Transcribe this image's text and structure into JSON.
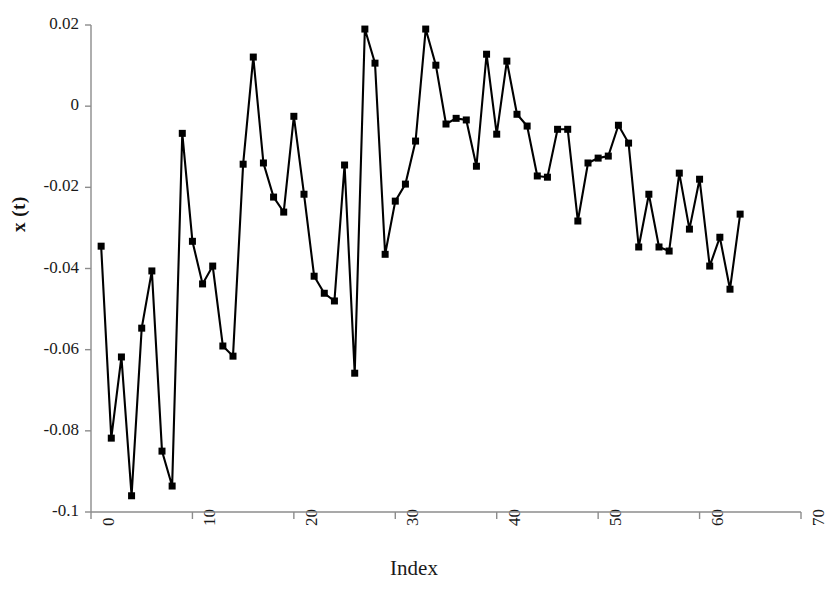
{
  "chart_data": {
    "type": "line",
    "title": "",
    "xlabel": "Index",
    "ylabel": "x (t)",
    "xlim": [
      0,
      70
    ],
    "ylim": [
      -0.1,
      0.02
    ],
    "xticks": [
      0,
      10,
      20,
      30,
      40,
      50,
      60,
      70
    ],
    "xtick_labels": [
      "0",
      "10",
      "20",
      "30",
      "40",
      "50",
      "60",
      "70"
    ],
    "yticks": [
      0.02,
      0,
      -0.02,
      -0.04,
      -0.06,
      -0.08,
      -0.1
    ],
    "ytick_labels": [
      "0.02",
      "0",
      "-0.02",
      "-0.04",
      "-0.06",
      "-0.08",
      "-0.1"
    ],
    "grid": false,
    "legend": false,
    "marker": "square",
    "marker_color": "#000000",
    "line_color": "#000000",
    "x": [
      1,
      2,
      3,
      4,
      5,
      6,
      7,
      8,
      9,
      10,
      11,
      12,
      13,
      14,
      15,
      16,
      17,
      18,
      19,
      20,
      21,
      22,
      23,
      24,
      25,
      26,
      27,
      28,
      29,
      30,
      31,
      32,
      33,
      34,
      35,
      36,
      37,
      38,
      39,
      40,
      41,
      42,
      43,
      44,
      45,
      46,
      47,
      48,
      49,
      50,
      51,
      52,
      53,
      54,
      55,
      56,
      57,
      58,
      59,
      60,
      61,
      62,
      63,
      64
    ],
    "values": [
      -0.0345,
      -0.0818,
      -0.0618,
      -0.096,
      -0.0547,
      -0.0406,
      -0.085,
      -0.0936,
      -0.0067,
      -0.0333,
      -0.0438,
      -0.0394,
      -0.0591,
      -0.0616,
      -0.0143,
      0.0121,
      -0.014,
      -0.0224,
      -0.0261,
      -0.0025,
      -0.0217,
      -0.0419,
      -0.0461,
      -0.048,
      -0.0145,
      -0.0658,
      0.019,
      0.0106,
      -0.0365,
      -0.0234,
      -0.0192,
      -0.0086,
      0.019,
      0.0101,
      -0.0044,
      -0.003,
      -0.0034,
      -0.0148,
      0.0128,
      -0.0069,
      0.0111,
      -0.002,
      -0.0049,
      -0.0172,
      -0.0175,
      -0.0057,
      -0.0057,
      -0.0283,
      -0.014,
      -0.0128,
      -0.0123,
      -0.0047,
      -0.0091,
      -0.0347,
      -0.0217,
      -0.0347,
      -0.0357,
      -0.0165,
      -0.0303,
      -0.018,
      -0.0394,
      -0.0323,
      -0.0451,
      -0.0266
    ]
  }
}
